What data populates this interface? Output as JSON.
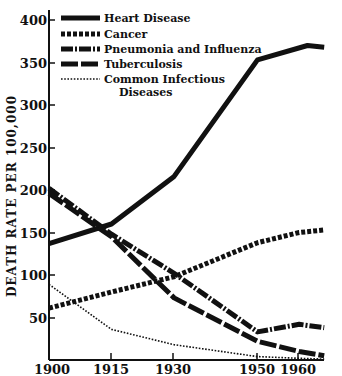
{
  "chart_data": {
    "type": "line",
    "title": "",
    "xlabel": "",
    "ylabel": "DEATH RATE PER 100,000",
    "xlim": [
      1900,
      1966
    ],
    "ylim": [
      0,
      410
    ],
    "x_ticks": [
      "1900",
      "1915",
      "1930",
      "1950",
      "1960"
    ],
    "y_ticks": [
      "50",
      "100",
      "150",
      "200",
      "250",
      "300",
      "350",
      "400"
    ],
    "grid": false,
    "legend_position": "upper left",
    "series": [
      {
        "name": "Heart Disease",
        "style": "solid-thick",
        "x": [
          1900,
          1915,
          1930,
          1950,
          1962,
          1966
        ],
        "values": [
          137,
          160,
          216,
          353,
          370,
          368
        ]
      },
      {
        "name": "Cancer",
        "style": "dotted-thick",
        "x": [
          1900,
          1915,
          1930,
          1950,
          1960,
          1966
        ],
        "values": [
          61,
          80,
          98,
          138,
          150,
          153
        ]
      },
      {
        "name": "Pneumonia and Influenza",
        "style": "dash-dot",
        "x": [
          1900,
          1915,
          1930,
          1950,
          1960,
          1966
        ],
        "values": [
          202,
          148,
          102,
          33,
          42,
          38
        ]
      },
      {
        "name": "Tuberculosis",
        "style": "long-dash",
        "x": [
          1900,
          1915,
          1930,
          1950,
          1960,
          1966
        ],
        "values": [
          196,
          145,
          73,
          22,
          10,
          5
        ]
      },
      {
        "name": "Common Infectious Diseases",
        "style": "fine-dotted",
        "x": [
          1900,
          1915,
          1930,
          1950,
          1960,
          1966
        ],
        "values": [
          89,
          36,
          18,
          4,
          2,
          1
        ]
      }
    ]
  },
  "legend": {
    "items": [
      {
        "label": "Heart Disease"
      },
      {
        "label": "Cancer"
      },
      {
        "label": "Pneumonia and Influenza"
      },
      {
        "label": "Tuberculosis"
      },
      {
        "label": "Common Infectious",
        "label2": "Diseases"
      }
    ]
  },
  "axis": {
    "ylabel": "DEATH RATE PER 100,000",
    "x_ticks": [
      "1900",
      "1915",
      "1930",
      "1950",
      "1960"
    ],
    "y_ticks": [
      "400",
      "350",
      "300",
      "250",
      "200",
      "150",
      "100",
      "50"
    ]
  }
}
